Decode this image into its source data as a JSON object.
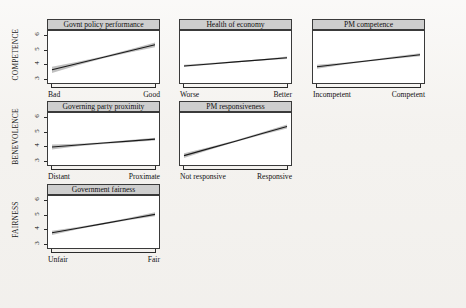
{
  "figure": {
    "background_color": "#f4f2ef",
    "panel_background_color": "#ffffff",
    "header_fill_color": "#cecece",
    "line_color": "#1a1a1a",
    "ci_band_color": "#a8a8a8"
  },
  "row_labels": [
    {
      "id": "competence",
      "text": "COMPETENCE"
    },
    {
      "id": "benevolence",
      "text": "BENEVOLENCE"
    },
    {
      "id": "fairness",
      "text": "FAIRNESS"
    }
  ],
  "y_axis": {
    "ticks": [
      "3",
      "4",
      "5",
      "6"
    ],
    "min": 2.7,
    "max": 6.3
  },
  "chart_data": {
    "type": "line",
    "title": "",
    "subtitle": "",
    "xlabel": "",
    "ylabel": "",
    "ylim": [
      2.7,
      6.3
    ],
    "grid": false,
    "legend": "none",
    "layout": {
      "rows": 3,
      "cols": 3,
      "shared_y_axis": true,
      "y_ticks_on_first_column_only": true
    },
    "row_groups": [
      "COMPETENCE",
      "BENEVOLENCE",
      "FAIRNESS"
    ],
    "panels": [
      {
        "id": "govnt-policy-performance",
        "row": "COMPETENCE",
        "col": 1,
        "title": "Govnt policy performance",
        "x_left_label": "Bad",
        "x_right_label": "Good",
        "show_y_ticks": true,
        "x": [
          0,
          0.25,
          0.5,
          0.75,
          1
        ],
        "fit": [
          3.62,
          4.05,
          4.48,
          4.92,
          5.35
        ],
        "ci_low": [
          3.4,
          3.93,
          4.42,
          4.82,
          5.18
        ],
        "ci_high": [
          3.82,
          4.17,
          4.55,
          5.02,
          5.5
        ]
      },
      {
        "id": "health-of-economy",
        "row": "COMPETENCE",
        "col": 2,
        "title": "Health of economy",
        "x_left_label": "Worse",
        "x_right_label": "Better",
        "show_y_ticks": false,
        "x": [
          0,
          0.25,
          0.5,
          0.75,
          1
        ],
        "fit": [
          3.88,
          4.02,
          4.16,
          4.3,
          4.45
        ],
        "ci_low": [
          3.8,
          3.97,
          4.12,
          4.25,
          4.37
        ],
        "ci_high": [
          3.96,
          4.08,
          4.2,
          4.35,
          4.53
        ]
      },
      {
        "id": "pm-competence",
        "row": "COMPETENCE",
        "col": 3,
        "title": "PM competence",
        "x_left_label": "Incompetent",
        "x_right_label": "Competent",
        "show_y_ticks": false,
        "x": [
          0,
          0.25,
          0.5,
          0.75,
          1
        ],
        "fit": [
          3.82,
          4.03,
          4.24,
          4.45,
          4.66
        ],
        "ci_low": [
          3.68,
          3.96,
          4.19,
          4.38,
          4.56
        ],
        "ci_high": [
          3.96,
          4.11,
          4.3,
          4.53,
          4.76
        ]
      },
      {
        "id": "governing-party-proximity",
        "row": "BENEVOLENCE",
        "col": 1,
        "title": "Governing party proximity",
        "x_left_label": "Distant",
        "x_right_label": "Proximate",
        "show_y_ticks": true,
        "x": [
          0,
          0.25,
          0.5,
          0.75,
          1
        ],
        "fit": [
          3.95,
          4.08,
          4.22,
          4.35,
          4.49
        ],
        "ci_low": [
          3.78,
          4.0,
          4.16,
          4.28,
          4.4
        ],
        "ci_high": [
          4.12,
          4.17,
          4.28,
          4.43,
          4.58
        ]
      },
      {
        "id": "pm-responsiveness",
        "row": "BENEVOLENCE",
        "col": 2,
        "title": "PM responsiveness",
        "x_left_label": "Not responsive",
        "x_right_label": "Responsive",
        "show_y_ticks": false,
        "x": [
          0,
          0.25,
          0.5,
          0.75,
          1
        ],
        "fit": [
          3.35,
          3.85,
          4.35,
          4.86,
          5.36
        ],
        "ci_low": [
          3.18,
          3.75,
          4.29,
          4.77,
          5.22
        ],
        "ci_high": [
          3.52,
          3.95,
          4.41,
          4.95,
          5.5
        ]
      },
      {
        "id": "government-fairness",
        "row": "FAIRNESS",
        "col": 1,
        "title": "Government fairness",
        "x_left_label": "Unfair",
        "x_right_label": "Fair",
        "show_y_ticks": true,
        "x": [
          0,
          0.25,
          0.5,
          0.75,
          1
        ],
        "fit": [
          3.75,
          4.07,
          4.39,
          4.71,
          5.03
        ],
        "ci_low": [
          3.6,
          3.99,
          4.33,
          4.63,
          4.89
        ],
        "ci_high": [
          3.9,
          4.15,
          4.45,
          4.79,
          5.17
        ]
      }
    ]
  }
}
